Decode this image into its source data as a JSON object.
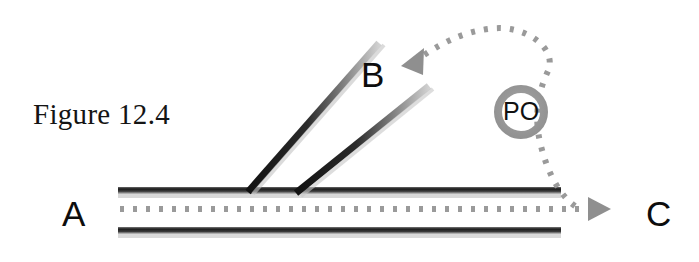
{
  "figure": {
    "caption": "Figure 12.4",
    "caption_position": {
      "x": 33,
      "y": 98
    },
    "canvas": {
      "width": 699,
      "height": 262,
      "background": "#ffffff"
    }
  },
  "colors": {
    "line_dark": "#1a1a1a",
    "line_shadow": "#8c8c8c",
    "dotted_path": "#9a9a9a",
    "ring": "#9d9d9d",
    "arrowhead": "#8f8f8f",
    "label_text": "#0d0d0d",
    "caption_text": "#141414"
  },
  "labels": [
    {
      "id": "label-a",
      "text": "A",
      "x": 62,
      "y": 196,
      "role": "origin-node"
    },
    {
      "id": "label-b",
      "text": "B",
      "x": 361,
      "y": 57,
      "role": "branch-node"
    },
    {
      "id": "label-c",
      "text": "C",
      "x": 646,
      "y": 196,
      "role": "destination-node"
    }
  ],
  "ring": {
    "label": "PO",
    "center": {
      "x": 521,
      "y": 112
    },
    "outer_radius": 27,
    "inner_radius": 19,
    "label_x": 503,
    "label_y": 99
  },
  "main_road": {
    "name": "horizontal-road",
    "top_line": {
      "x1": 118,
      "y1": 190,
      "x2": 561,
      "y2": 190
    },
    "bottom_line": {
      "x1": 118,
      "y1": 230,
      "x2": 561,
      "y2": 230
    },
    "thickness": 6
  },
  "branch_road": {
    "name": "diagonal-branch",
    "left_line": {
      "x1": 248,
      "y1": 191,
      "x2": 379,
      "y2": 43
    },
    "right_line": {
      "x1": 296,
      "y1": 192,
      "x2": 429,
      "y2": 86
    },
    "thickness": 6
  },
  "dotted_paths": [
    {
      "id": "path-a-to-c",
      "description": "straight dotted route from A through the junction to C",
      "d": "M 120 209 L 592 209",
      "dash": "4 9"
    },
    {
      "id": "path-loop-to-b",
      "description": "dotted loop from the C route up around PO and back down to B",
      "d": "M 572 209 C 556 196 546 170 540 146 C 534 122 536 96 546 72 C 556 48 524 24 489 29 C 460 33 440 45 420 57",
      "dash": "4 9"
    }
  ],
  "arrowheads": [
    {
      "id": "arrow-to-b",
      "x": 404,
      "y": 63,
      "angle": 206,
      "size": 17
    },
    {
      "id": "arrow-to-c",
      "x": 600,
      "y": 209,
      "angle": 0,
      "size": 17
    }
  ]
}
